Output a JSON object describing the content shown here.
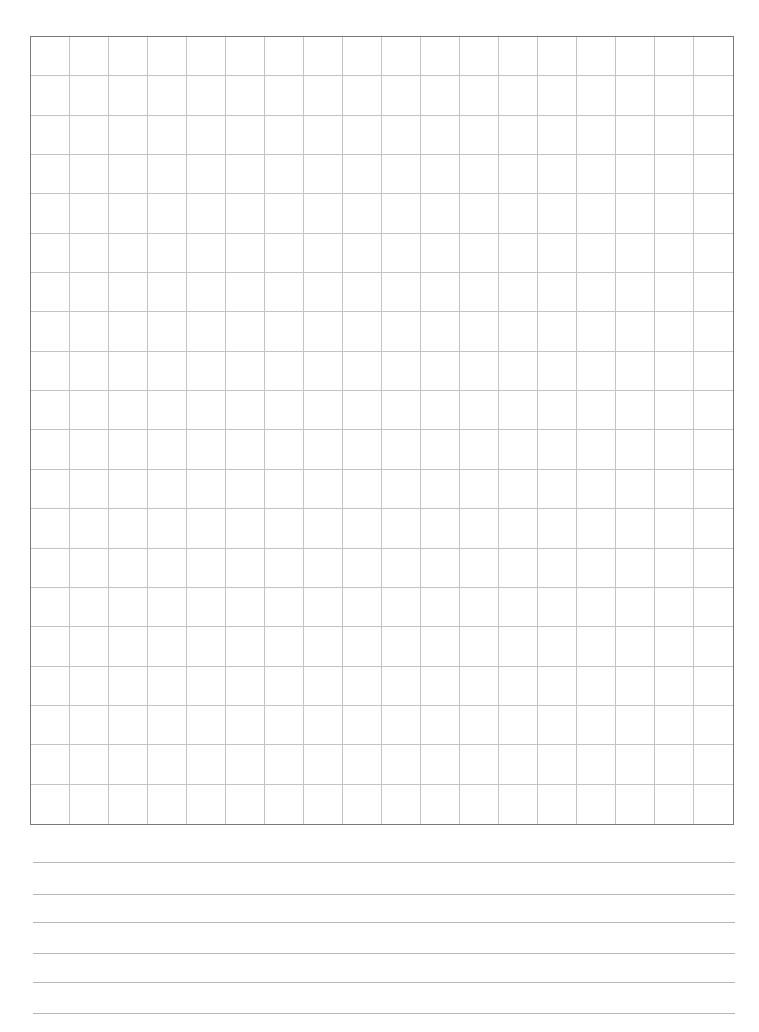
{
  "page": {
    "type": "graph-paper-worksheet",
    "grid": {
      "columns": 18,
      "rows": 20,
      "line_color": "#c4c4c4",
      "border_color": "#7a7a7a"
    },
    "writing_lines": {
      "count": 6,
      "line_color": "#b8b8b8",
      "positions_y": [
        862,
        894,
        922,
        953,
        982,
        1013
      ]
    }
  }
}
